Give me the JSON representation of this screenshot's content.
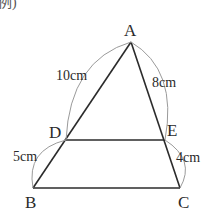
{
  "caption": "例)",
  "vertices": {
    "A": {
      "label": "A",
      "x": 131,
      "y": 42
    },
    "B": {
      "label": "B",
      "x": 33,
      "y": 188
    },
    "C": {
      "label": "C",
      "x": 180,
      "y": 188
    },
    "D": {
      "label": "D",
      "x": 66,
      "y": 140
    },
    "E": {
      "label": "E",
      "x": 165,
      "y": 140
    }
  },
  "lengths": {
    "AD": "10cm",
    "AE": "8cm",
    "DB": "5cm",
    "EC": "4cm"
  },
  "colors": {
    "line": "#2b2b2b",
    "arc": "#9a9a9a",
    "text": "#2a2a2a"
  }
}
